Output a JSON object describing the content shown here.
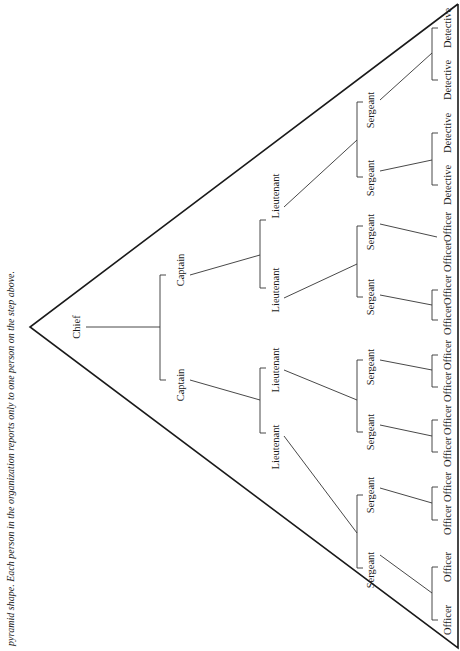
{
  "caption": "pyramid shape. Each person in the organization reports only to one person on the step above.",
  "colors": {
    "line": "#333333",
    "text": "#1a1a1a",
    "background": "#ffffff"
  },
  "triangle": {
    "apex": [
      30,
      327
    ],
    "top_right": [
      458,
      4
    ],
    "bottom_right": [
      458,
      648
    ]
  },
  "nodes": [
    {
      "id": "chief",
      "label": "Chief",
      "x": 78,
      "y": 327
    },
    {
      "id": "cap1",
      "label": "Captain",
      "x": 182,
      "y": 270
    },
    {
      "id": "cap2",
      "label": "Captain",
      "x": 182,
      "y": 385
    },
    {
      "id": "lt1",
      "label": "Lieutenant",
      "x": 277,
      "y": 196
    },
    {
      "id": "lt2",
      "label": "Lieutenant",
      "x": 277,
      "y": 290
    },
    {
      "id": "lt3",
      "label": "Lieutenant",
      "x": 277,
      "y": 370
    },
    {
      "id": "lt4",
      "label": "Lieutenant",
      "x": 277,
      "y": 447
    },
    {
      "id": "sg1",
      "label": "Sergeant",
      "x": 372,
      "y": 110
    },
    {
      "id": "sg2",
      "label": "Sergeant",
      "x": 372,
      "y": 178
    },
    {
      "id": "sg3",
      "label": "Sergeant",
      "x": 372,
      "y": 232
    },
    {
      "id": "sg4",
      "label": "Sergeant",
      "x": 372,
      "y": 297
    },
    {
      "id": "sg5",
      "label": "Sergeant",
      "x": 372,
      "y": 367
    },
    {
      "id": "sg6",
      "label": "Sergeant",
      "x": 372,
      "y": 432
    },
    {
      "id": "sg7",
      "label": "Sergeant",
      "x": 372,
      "y": 495
    },
    {
      "id": "sg8",
      "label": "Sergeant",
      "x": 372,
      "y": 570
    },
    {
      "id": "lf1",
      "label": "Detective",
      "x": 449,
      "y": 28
    },
    {
      "id": "lf2",
      "label": "Detective",
      "x": 449,
      "y": 80
    },
    {
      "id": "lf3",
      "label": "Detective",
      "x": 449,
      "y": 133
    },
    {
      "id": "lf4",
      "label": "Detective",
      "x": 449,
      "y": 185
    },
    {
      "id": "lf5",
      "label": "Officer",
      "x": 449,
      "y": 227
    },
    {
      "id": "lf6",
      "label": "Officer",
      "x": 449,
      "y": 257
    },
    {
      "id": "lf7",
      "label": "Officer",
      "x": 449,
      "y": 290
    },
    {
      "id": "lf8",
      "label": "Officer",
      "x": 449,
      "y": 320
    },
    {
      "id": "lf9",
      "label": "Officer",
      "x": 449,
      "y": 355
    },
    {
      "id": "lf10",
      "label": "Officer",
      "x": 449,
      "y": 387
    },
    {
      "id": "lf11",
      "label": "Officer",
      "x": 449,
      "y": 420
    },
    {
      "id": "lf12",
      "label": "Officer",
      "x": 449,
      "y": 452
    },
    {
      "id": "lf13",
      "label": "Officer",
      "x": 449,
      "y": 487
    },
    {
      "id": "lf14",
      "label": "Officer",
      "x": 449,
      "y": 520
    },
    {
      "id": "lf15",
      "label": "Officer",
      "x": 449,
      "y": 567
    },
    {
      "id": "lf16",
      "label": "Officer",
      "x": 449,
      "y": 620
    }
  ],
  "connectors": [
    {
      "from": [
        86,
        327
      ],
      "to": [
        160,
        327
      ]
    },
    {
      "from": [
        160,
        275
      ],
      "to": [
        160,
        380
      ],
      "bracket": true
    },
    {
      "from": [
        190,
        275
      ],
      "to": [
        260,
        255
      ]
    },
    {
      "from": [
        260,
        220
      ],
      "to": [
        260,
        288
      ],
      "bracket": true
    },
    {
      "from": [
        190,
        380
      ],
      "to": [
        260,
        400
      ]
    },
    {
      "from": [
        260,
        368
      ],
      "to": [
        260,
        433
      ],
      "bracket": true
    },
    {
      "from": [
        284,
        207
      ],
      "to": [
        357,
        140
      ]
    },
    {
      "from": [
        357,
        102
      ],
      "to": [
        357,
        177
      ],
      "bracket": true
    },
    {
      "from": [
        284,
        298
      ],
      "to": [
        357,
        264
      ]
    },
    {
      "from": [
        357,
        226
      ],
      "to": [
        357,
        297
      ],
      "bracket": true
    },
    {
      "from": [
        284,
        370
      ],
      "to": [
        357,
        400
      ]
    },
    {
      "from": [
        357,
        360
      ],
      "to": [
        357,
        432
      ],
      "bracket": true
    },
    {
      "from": [
        284,
        436
      ],
      "to": [
        357,
        533
      ]
    },
    {
      "from": [
        357,
        495
      ],
      "to": [
        357,
        568
      ],
      "bracket": true
    },
    {
      "from": [
        380,
        100
      ],
      "to": [
        432,
        53
      ]
    },
    {
      "from": [
        432,
        28
      ],
      "to": [
        432,
        80
      ],
      "bracket": true
    },
    {
      "from": [
        380,
        171
      ],
      "to": [
        432,
        160
      ]
    },
    {
      "from": [
        432,
        133
      ],
      "to": [
        432,
        185
      ],
      "bracket": true
    },
    {
      "from": [
        380,
        224
      ],
      "to": [
        437,
        237
      ]
    },
    {
      "from": [
        380,
        295
      ],
      "to": [
        432,
        305
      ]
    },
    {
      "from": [
        432,
        290
      ],
      "to": [
        432,
        320
      ],
      "bracket": true
    },
    {
      "from": [
        380,
        360
      ],
      "to": [
        432,
        370
      ]
    },
    {
      "from": [
        432,
        355
      ],
      "to": [
        432,
        387
      ],
      "bracket": true
    },
    {
      "from": [
        380,
        425
      ],
      "to": [
        432,
        436
      ]
    },
    {
      "from": [
        432,
        420
      ],
      "to": [
        432,
        452
      ],
      "bracket": true
    },
    {
      "from": [
        380,
        488
      ],
      "to": [
        432,
        503
      ]
    },
    {
      "from": [
        432,
        487
      ],
      "to": [
        432,
        520
      ],
      "bracket": true
    },
    {
      "from": [
        380,
        555
      ],
      "to": [
        432,
        593
      ]
    },
    {
      "from": [
        432,
        567
      ],
      "to": [
        432,
        620
      ],
      "bracket": true
    }
  ]
}
